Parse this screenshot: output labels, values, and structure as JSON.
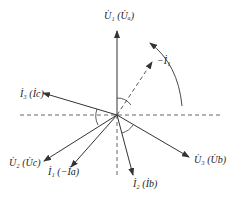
{
  "diagram": {
    "type": "phasor-diagram",
    "origin": {
      "x": 117,
      "y": 115
    },
    "colors": {
      "line": "#333333",
      "dashed": "#555555",
      "text": "#222222",
      "background": "#ffffff"
    },
    "axes": {
      "horizontal": {
        "x1": 20,
        "x2": 222,
        "y": 115,
        "style": "dashed"
      },
      "vertical_down": {
        "x": 117,
        "y1": 115,
        "y2": 178,
        "style": "dashed"
      }
    },
    "vectors": [
      {
        "id": "U1",
        "label": "U̇₁ (U̇ₐ)",
        "to": {
          "x": 117,
          "y": 30
        },
        "style": "solid"
      },
      {
        "id": "neg-I1",
        "label": "−İ₁",
        "to": {
          "x": 153,
          "y": 61
        },
        "style": "dashed"
      },
      {
        "id": "I3",
        "label": "İ₃ (İc)",
        "to": {
          "x": 42,
          "y": 93
        },
        "style": "solid"
      },
      {
        "id": "U2",
        "label": "U̇₂ (U̇c)",
        "to": {
          "x": 43,
          "y": 162
        },
        "style": "solid"
      },
      {
        "id": "I1",
        "label": "İ₁ (−İa)",
        "to": {
          "x": 70,
          "y": 168
        },
        "style": "solid"
      },
      {
        "id": "I2",
        "label": "İ₂ (İb)",
        "to": {
          "x": 134,
          "y": 176
        },
        "style": "solid"
      },
      {
        "id": "U3",
        "label": "U̇₃ (U̇b)",
        "to": {
          "x": 190,
          "y": 158
        },
        "style": "solid"
      }
    ],
    "labels": {
      "U1": "U̇₁ (U̇ₐ)",
      "negI1": "−İ₁",
      "I3": "İ₃ (İc)",
      "U2": "U̇₂ (U̇c)",
      "I1": "İ₁ (−İa)",
      "I2": "İ₂ (İb)",
      "U3": "U̇₃ (U̇b)"
    },
    "rotation_arrow": {
      "direction": "counter-clockwise",
      "from": {
        "x": 182,
        "y": 106
      },
      "to": {
        "x": 148,
        "y": 42
      }
    },
    "angle_arcs": [
      {
        "between": [
          "U1",
          "neg-I1"
        ]
      },
      {
        "between": [
          "horizontal-left",
          "I3"
        ]
      },
      {
        "between": [
          "I2",
          "U3"
        ]
      }
    ]
  }
}
